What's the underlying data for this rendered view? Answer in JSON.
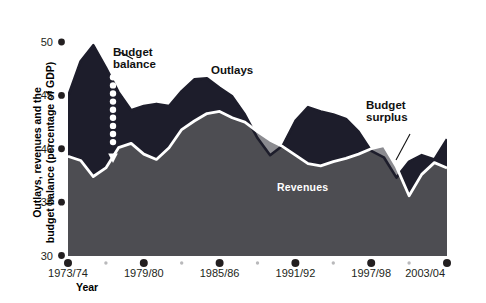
{
  "chart_data": {
    "type": "area",
    "title": "",
    "xlabel": "Year",
    "ylabel": "Outlays, revenues and the budget balance (percentage of GDP)",
    "ylim": [
      30,
      50
    ],
    "yticks": [
      30,
      35,
      40,
      45,
      50
    ],
    "ytick_labels": [
      "30",
      "35",
      "40",
      "45",
      "50"
    ],
    "xlim": [
      "1973/74",
      "2003/04"
    ],
    "xticks": [
      "1973/74",
      "1979/80",
      "1985/86",
      "1991/92",
      "1997/98",
      "2003/04"
    ],
    "minor_xticks": [
      "1976/77",
      "1982/83",
      "1988/89",
      "1994/95",
      "2000/01"
    ],
    "grid": false,
    "legend_position": "inline-annotations",
    "x": [
      "1973/74",
      "1974/75",
      "1975/76",
      "1976/77",
      "1977/78",
      "1978/79",
      "1979/80",
      "1980/81",
      "1981/82",
      "1982/83",
      "1983/84",
      "1984/85",
      "1985/86",
      "1986/87",
      "1987/88",
      "1988/89",
      "1989/90",
      "1990/91",
      "1991/92",
      "1992/93",
      "1993/94",
      "1994/95",
      "1995/96",
      "1996/97",
      "1997/98",
      "1998/99",
      "1999/00",
      "2000/01",
      "2001/02",
      "2002/03",
      "2003/04"
    ],
    "series": [
      {
        "name": "Outlays",
        "color": "#1d1d2b",
        "values": [
          44.9,
          48.2,
          49.7,
          47.6,
          45.3,
          43.6,
          44.0,
          44.2,
          44.0,
          45.4,
          46.5,
          46.6,
          45.7,
          44.9,
          43.2,
          41.0,
          39.4,
          40.3,
          42.6,
          43.9,
          43.5,
          43.2,
          42.8,
          41.6,
          39.8,
          39.2,
          37.3,
          38.8,
          39.4,
          39.0,
          40.9
        ]
      },
      {
        "name": "Revenues",
        "color": "#4d4d52",
        "values": [
          39.3,
          38.9,
          37.4,
          38.2,
          40.1,
          40.5,
          39.5,
          39.0,
          40.1,
          41.8,
          42.6,
          43.3,
          43.5,
          42.9,
          42.5,
          41.6,
          40.8,
          40.2,
          39.4,
          38.6,
          38.4,
          38.8,
          39.1,
          39.5,
          40.0,
          40.3,
          38.3,
          35.6,
          37.6,
          38.7,
          38.2
        ]
      }
    ],
    "annotations": [
      {
        "name": "budget-balance",
        "text": "Budget balance",
        "kind": "gap-dark",
        "meaning": "deficit: outlays above revenues"
      },
      {
        "name": "outlays",
        "text": "Outlays",
        "kind": "series-label"
      },
      {
        "name": "revenues",
        "text": "Revenues",
        "kind": "series-label"
      },
      {
        "name": "budget-surplus",
        "text": "Budget surplus",
        "kind": "gap-gray",
        "meaning": "surplus: revenues above outlays"
      }
    ],
    "colors": {
      "outlays_fill": "#1d1d2b",
      "revenues_fill": "#4d4d52",
      "surplus_fill": "#8b8b90",
      "revenues_line": "#ffffff",
      "axis": "#231f20",
      "background": "#ffffff"
    }
  },
  "axis": {
    "y_title_line1": "Outlays, revenues and the",
    "y_title_line2": "budget balance (percentage of GDP)",
    "x_title": "Year"
  },
  "annotations": {
    "budget_balance": {
      "line1": "Budget",
      "line2": "balance"
    },
    "budget_surplus": {
      "line1": "Budget",
      "line2": "surplus"
    },
    "outlays": "Outlays",
    "revenues": "Revenues"
  }
}
